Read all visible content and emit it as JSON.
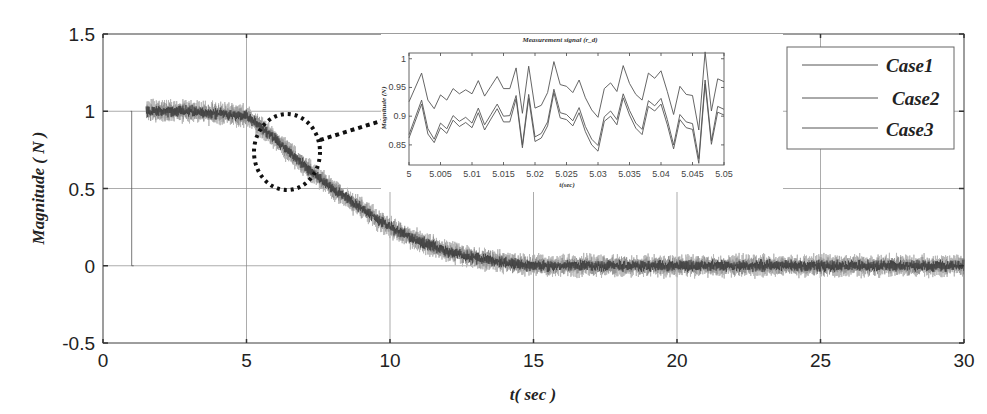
{
  "chart_data": [
    {
      "id": "main",
      "type": "line",
      "title": "",
      "xlabel": "t( sec )",
      "ylabel": "Magnitude ( N )",
      "xlim": [
        0,
        30
      ],
      "ylim": [
        -0.5,
        1.5
      ],
      "xticks": [
        0,
        5,
        10,
        15,
        20,
        25,
        30
      ],
      "xtick_labels": [
        "0",
        "5",
        "10",
        "15",
        "20",
        "25",
        "30"
      ],
      "yticks": [
        -0.5,
        0,
        0.5,
        1,
        1.5
      ],
      "ytick_labels": [
        "-0.5",
        "0",
        "0.5",
        "1",
        "1.5"
      ],
      "grid": true,
      "legend_position": "upper right",
      "reference_step": {
        "t": 1,
        "from": 1,
        "to": 0
      },
      "signal_start_t": 1.5,
      "noise_amplitude": 0.07,
      "series": [
        {
          "name": "Case1",
          "description": "noisy measured signal, ~1 until t=5, sigmoid decay to ~0 by t=15"
        },
        {
          "name": "Case2",
          "description": "noisy measured signal, overlapping Case1"
        },
        {
          "name": "Case3",
          "description": "noisy measured signal, overlapping Case1"
        }
      ],
      "envelope": {
        "t": [
          1.5,
          3,
          5,
          6,
          7,
          8,
          9,
          10,
          11,
          12,
          13,
          14,
          15,
          20,
          25,
          30
        ],
        "mean": [
          1.0,
          1.0,
          0.97,
          0.82,
          0.65,
          0.5,
          0.37,
          0.25,
          0.16,
          0.09,
          0.05,
          0.02,
          0.0,
          0.0,
          0.0,
          0.0
        ]
      },
      "annotations": [
        {
          "type": "dotted-ellipse",
          "center_t": 6.5,
          "center_y": 0.7,
          "text": ""
        },
        {
          "type": "dotted-arrow",
          "from": "ellipse",
          "to": "inset",
          "text": ""
        }
      ]
    },
    {
      "id": "inset",
      "type": "line",
      "title": "Measurement signal (r_d)",
      "xlabel": "t(sec)",
      "ylabel": "Magnitude (N)",
      "xlim": [
        5,
        5.05
      ],
      "ylim": [
        0.815,
        1.01
      ],
      "xticks": [
        5,
        5.005,
        5.01,
        5.015,
        5.02,
        5.025,
        5.03,
        5.035,
        5.04,
        5.045,
        5.05
      ],
      "xtick_labels": [
        "5",
        "5.005",
        "5.01",
        "5.015",
        "5.02",
        "5.025",
        "5.03",
        "5.035",
        "5.04",
        "5.045",
        "5.05"
      ],
      "yticks": [
        0.85,
        0.9,
        0.95,
        1
      ],
      "ytick_labels": [
        "0.85",
        "0.9",
        "0.95",
        "1"
      ],
      "x": [
        5.0,
        5.002,
        5.003,
        5.004,
        5.005,
        5.006,
        5.007,
        5.008,
        5.009,
        5.01,
        5.011,
        5.012,
        5.013,
        5.014,
        5.015,
        5.016,
        5.017,
        5.018,
        5.019,
        5.02,
        5.021,
        5.022,
        5.023,
        5.024,
        5.025,
        5.026,
        5.027,
        5.028,
        5.029,
        5.03,
        5.031,
        5.032,
        5.033,
        5.034,
        5.035,
        5.036,
        5.037,
        5.038,
        5.039,
        5.04,
        5.041,
        5.042,
        5.043,
        5.044,
        5.045,
        5.046,
        5.047,
        5.048,
        5.049,
        5.05
      ],
      "series": [
        {
          "name": "Case1",
          "values": [
            0.925,
            0.975,
            0.928,
            0.913,
            0.937,
            0.928,
            0.948,
            0.939,
            0.946,
            0.939,
            0.962,
            0.935,
            0.952,
            0.969,
            0.948,
            0.948,
            0.984,
            0.905,
            0.987,
            0.914,
            0.919,
            0.941,
            0.995,
            0.955,
            0.952,
            0.941,
            0.963,
            0.932,
            0.911,
            0.898,
            0.948,
            0.958,
            0.943,
            0.988,
            0.957,
            0.938,
            0.928,
            0.975,
            0.966,
            0.979,
            0.943,
            0.903,
            0.952,
            0.938,
            0.936,
            0.876,
            1.012,
            0.909,
            0.965,
            0.96
          ]
        },
        {
          "name": "Case2",
          "values": [
            0.868,
            0.928,
            0.878,
            0.86,
            0.888,
            0.878,
            0.901,
            0.891,
            0.898,
            0.888,
            0.914,
            0.885,
            0.903,
            0.921,
            0.9,
            0.901,
            0.936,
            0.85,
            0.938,
            0.864,
            0.87,
            0.89,
            0.947,
            0.906,
            0.903,
            0.892,
            0.915,
            0.882,
            0.86,
            0.849,
            0.899,
            0.909,
            0.894,
            0.939,
            0.91,
            0.888,
            0.877,
            0.927,
            0.918,
            0.931,
            0.894,
            0.85,
            0.903,
            0.89,
            0.887,
            0.826,
            0.963,
            0.857,
            0.917,
            0.912
          ]
        },
        {
          "name": "Case3",
          "values": [
            0.862,
            0.921,
            0.869,
            0.854,
            0.88,
            0.87,
            0.893,
            0.882,
            0.889,
            0.88,
            0.906,
            0.876,
            0.895,
            0.913,
            0.89,
            0.89,
            0.93,
            0.845,
            0.931,
            0.856,
            0.862,
            0.883,
            0.941,
            0.897,
            0.894,
            0.883,
            0.906,
            0.873,
            0.85,
            0.839,
            0.891,
            0.9,
            0.885,
            0.932,
            0.902,
            0.879,
            0.868,
            0.917,
            0.909,
            0.921,
            0.885,
            0.843,
            0.894,
            0.88,
            0.877,
            0.818,
            0.956,
            0.851,
            0.907,
            0.902
          ]
        }
      ]
    }
  ],
  "legend": {
    "items": [
      {
        "label": "Case1"
      },
      {
        "label": "Case2"
      },
      {
        "label": "Case3"
      }
    ]
  },
  "colors": {
    "axis": "#555555",
    "grid": "#888888",
    "signal_light": "#b8b8b8",
    "signal_dark": "#333333",
    "annotation": "#111111"
  }
}
